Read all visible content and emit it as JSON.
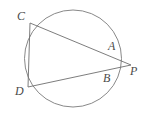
{
  "figure": {
    "type": "circle-geometry-diagram",
    "stroke_color": "#6e6e6e",
    "label_color": "#4a4a4a",
    "background_color": "#ffffff",
    "width": 151,
    "height": 118,
    "circle": {
      "center_x": 73,
      "center_y": 58.5,
      "radius": 48.5
    },
    "points": [
      {
        "id": "C",
        "label": "C",
        "x": 30,
        "y": 23,
        "label_x": 17,
        "label_y": 10
      },
      {
        "id": "A",
        "label": "A",
        "x": 105,
        "y": 54,
        "label_x": 108,
        "label_y": 40
      },
      {
        "id": "B",
        "label": "B",
        "x": 105.5,
        "y": 69,
        "label_x": 103,
        "label_y": 72
      },
      {
        "id": "P",
        "label": "P",
        "x": 131,
        "y": 65,
        "label_x": 130,
        "label_y": 65
      },
      {
        "id": "D",
        "label": "D",
        "x": 28,
        "y": 87,
        "label_x": 15,
        "label_y": 85
      }
    ],
    "segments": [
      {
        "id": "CP",
        "from": "C",
        "to": "P",
        "through": "A"
      },
      {
        "id": "DP",
        "from": "D",
        "to": "P",
        "through": "B"
      },
      {
        "id": "CD",
        "from": "C",
        "to": "D",
        "through": ""
      }
    ]
  }
}
